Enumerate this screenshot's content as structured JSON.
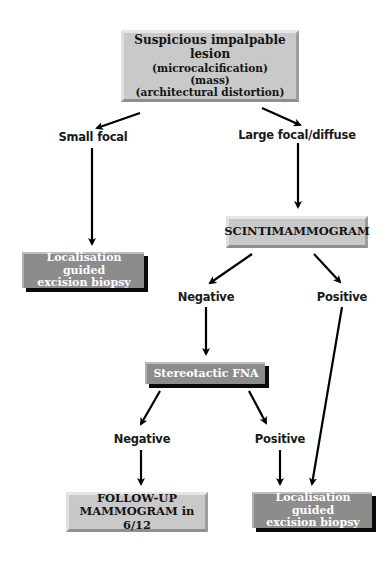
{
  "diagram": {
    "type": "flowchart",
    "nodes": {
      "root": {
        "title": "Suspicious impalpable lesion",
        "subtitles": [
          "(microcalcification)",
          "(mass)",
          "(architectural distortion)"
        ]
      },
      "scinti": {
        "label": "SCINTIMAMMOGRAM"
      },
      "biopsy_left": {
        "line1": "Localisation guided",
        "line2": "excision biopsy"
      },
      "stereo": {
        "label": "Stereotactic FNA"
      },
      "followup": {
        "line1": "FOLLOW-UP",
        "line2": "MAMMOGRAM in 6/12"
      },
      "biopsy_right": {
        "line1": "Localisation guided",
        "line2": "excision biopsy"
      }
    },
    "edge_labels": {
      "small_focal": "Small focal",
      "large_focal": "Large focal/diffuse",
      "scinti_negative": "Negative",
      "scinti_positive": "Positive",
      "fna_negative": "Negative",
      "fna_positive": "Positive"
    },
    "edges": [
      {
        "from": "root",
        "to": "small_focal"
      },
      {
        "from": "root",
        "to": "large_focal"
      },
      {
        "from": "small_focal",
        "to": "biopsy_left"
      },
      {
        "from": "large_focal",
        "to": "scinti"
      },
      {
        "from": "scinti",
        "to": "scinti_negative"
      },
      {
        "from": "scinti",
        "to": "scinti_positive"
      },
      {
        "from": "scinti_negative",
        "to": "stereo"
      },
      {
        "from": "scinti_positive",
        "to": "biopsy_right"
      },
      {
        "from": "stereo",
        "to": "fna_negative"
      },
      {
        "from": "stereo",
        "to": "fna_positive"
      },
      {
        "from": "fna_negative",
        "to": "followup"
      },
      {
        "from": "fna_positive",
        "to": "biopsy_right"
      }
    ],
    "colors": {
      "light_box": "#c9c9c9",
      "dark_box": "#8c8c8c",
      "dark_box_shadow": "#0a0a0a",
      "arrow": "#000000",
      "text": "#141414"
    }
  }
}
